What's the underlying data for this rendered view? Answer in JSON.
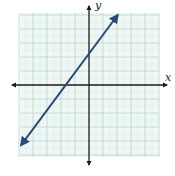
{
  "chart_data": {
    "type": "line",
    "title": "",
    "xlabel": "x",
    "ylabel": "y",
    "xlim": [
      -10,
      10
    ],
    "ylim": [
      -10,
      10
    ],
    "grid": true,
    "grid_major_step": 2,
    "grid_minor_step": 1,
    "tick_labels": false,
    "series": [
      {
        "name": "line",
        "style": "double-arrow",
        "color": "#2b4a7a",
        "x": [
          -9.7,
          4.1
        ],
        "y": [
          -8.6,
          10.0
        ],
        "x_intercept_approx": -3.7,
        "y_intercept_approx": 4.7
      }
    ]
  },
  "labels": {
    "x_axis": "x",
    "y_axis": "y"
  },
  "colors": {
    "grid_bg": "#eef7f4",
    "grid_major": "#b9d6cf",
    "grid_minor": "#c9dfd9",
    "axis": "#1a1a1a",
    "line": "#2b4a7a"
  },
  "geometry": {
    "plot_left": 20,
    "plot_top": 13,
    "plot_right": 159,
    "plot_bottom": 157,
    "origin_x": 89,
    "origin_y": 85,
    "px_per_unit": 7
  }
}
